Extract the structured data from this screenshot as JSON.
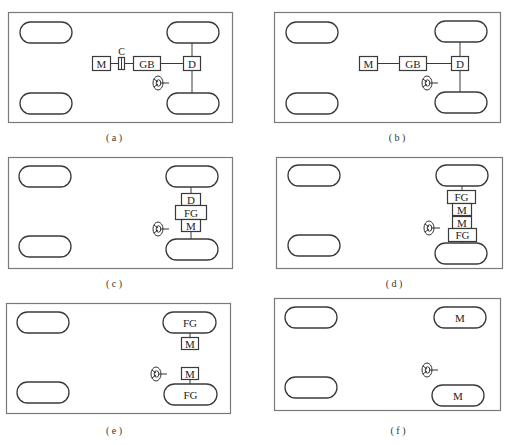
{
  "figure": {
    "panels": [
      {
        "id": "a",
        "caption": "( a )",
        "components": {
          "motor": "M",
          "clutch": "C",
          "gearbox": "GB",
          "differential": "D"
        }
      },
      {
        "id": "b",
        "caption": "( b )",
        "components": {
          "motor": "M",
          "gearbox": "GB",
          "differential": "D"
        }
      },
      {
        "id": "c",
        "caption": "( c )",
        "components": {
          "differential": "D",
          "fixed_gear": "FG",
          "motor": "M"
        }
      },
      {
        "id": "d",
        "caption": "( d )",
        "components": {
          "fixed_gear_top": "FG",
          "motor_top": "M",
          "motor_bottom": "M",
          "fixed_gear_bottom": "FG"
        }
      },
      {
        "id": "e",
        "caption": "( e )",
        "components": {
          "wheel_top": "FG",
          "motor_top": "M",
          "motor_bottom": "M",
          "wheel_bottom": "FG"
        }
      },
      {
        "id": "f",
        "caption": "( f )",
        "components": {
          "wheel_top": "M",
          "wheel_bottom": "M"
        }
      }
    ],
    "colors": {
      "frame": "#7a7a7a",
      "stroke": "#3a3a3a",
      "text": "#222222",
      "background": "#ffffff"
    }
  }
}
